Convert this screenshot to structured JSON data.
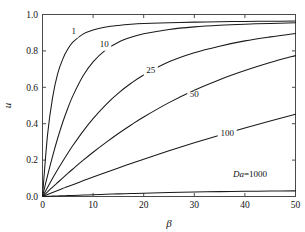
{
  "chart_data": {
    "type": "line",
    "title": "",
    "subtitle": "",
    "xlabel": "β",
    "ylabel": "u",
    "xlim": [
      0,
      50
    ],
    "ylim": [
      0,
      1.0
    ],
    "xticks": [
      0,
      10,
      20,
      30,
      40,
      50
    ],
    "yticks": [
      0.0,
      0.2,
      0.4,
      0.6,
      0.8,
      1.0
    ],
    "xticklabels": [
      "0",
      "10",
      "20",
      "30",
      "40",
      "50"
    ],
    "yticklabels": [
      "0.0",
      "0.2",
      "0.4",
      "0.6",
      "0.8",
      "1.0"
    ],
    "grid": false,
    "legend": "inline-curve-labels",
    "line_color": "#1a1a1a",
    "axis_color": "#4a4a4a",
    "background": "#ffffff",
    "x": [
      0,
      1,
      2,
      3,
      4,
      5,
      6,
      8,
      10,
      12.5,
      15,
      17.5,
      20,
      25,
      30,
      35,
      40,
      45,
      50
    ],
    "series": [
      {
        "name": "1",
        "label": "1",
        "values": [
          0.0,
          0.34,
          0.545,
          0.675,
          0.755,
          0.81,
          0.848,
          0.892,
          0.915,
          0.931,
          0.94,
          0.946,
          0.95,
          0.955,
          0.958,
          0.96,
          0.962,
          0.963,
          0.964
        ],
        "label_x": 6.2,
        "label_y": 0.895
      },
      {
        "name": "10",
        "label": "10",
        "values": [
          0.0,
          0.115,
          0.222,
          0.32,
          0.408,
          0.485,
          0.553,
          0.662,
          0.74,
          0.806,
          0.848,
          0.875,
          0.894,
          0.918,
          0.932,
          0.941,
          0.947,
          0.951,
          0.955
        ],
        "label_x": 12.2,
        "label_y": 0.823
      },
      {
        "name": "25",
        "label": "25",
        "values": [
          0.0,
          0.05,
          0.1,
          0.148,
          0.194,
          0.238,
          0.28,
          0.358,
          0.428,
          0.504,
          0.568,
          0.622,
          0.668,
          0.74,
          0.79,
          0.826,
          0.855,
          0.877,
          0.896
        ],
        "label_x": 21.4,
        "label_y": 0.68
      },
      {
        "name": "50",
        "label": "50",
        "values": [
          0.0,
          0.026,
          0.052,
          0.077,
          0.102,
          0.127,
          0.151,
          0.198,
          0.243,
          0.296,
          0.346,
          0.393,
          0.437,
          0.516,
          0.584,
          0.642,
          0.692,
          0.736,
          0.774
        ],
        "label_x": 30.0,
        "label_y": 0.545
      },
      {
        "name": "100",
        "label": "100",
        "values": [
          0.0,
          0.011,
          0.022,
          0.033,
          0.044,
          0.055,
          0.065,
          0.086,
          0.107,
          0.132,
          0.157,
          0.181,
          0.205,
          0.251,
          0.295,
          0.337,
          0.377,
          0.415,
          0.452
        ],
        "label_x": 36.5,
        "label_y": 0.335
      },
      {
        "name": "1000",
        "label": "Da=1000",
        "values": [
          0.0,
          0.001,
          0.002,
          0.003,
          0.004,
          0.005,
          0.006,
          0.008,
          0.01,
          0.0122,
          0.0144,
          0.0164,
          0.0183,
          0.0216,
          0.0244,
          0.0267,
          0.0285,
          0.0299,
          0.031
        ],
        "label_x": 41.0,
        "label_y": 0.105
      }
    ]
  },
  "labels": {
    "da_prefix": "Da",
    "da_equals": "=1000"
  }
}
